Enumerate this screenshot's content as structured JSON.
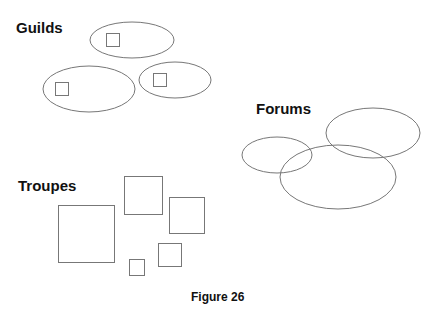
{
  "labels": {
    "guilds": "Guilds",
    "forums": "Forums",
    "troupes": "Troupes"
  },
  "caption": "Figure 26",
  "stroke_color": "#777777",
  "groups": {
    "guilds": {
      "ellipses": [
        {
          "cx": 132,
          "cy": 40,
          "rx": 42,
          "ry": 18,
          "square": {
            "x": 106,
            "y": 33,
            "size": 13
          }
        },
        {
          "cx": 89,
          "cy": 89,
          "rx": 46,
          "ry": 23,
          "square": {
            "x": 55,
            "y": 82,
            "size": 13
          }
        },
        {
          "cx": 175,
          "cy": 80,
          "rx": 36,
          "ry": 18,
          "square": {
            "x": 153,
            "y": 73,
            "size": 13
          }
        }
      ]
    },
    "forums": {
      "ellipses": [
        {
          "cx": 373,
          "cy": 133,
          "rx": 47,
          "ry": 25
        },
        {
          "cx": 277,
          "cy": 155,
          "rx": 35,
          "ry": 18
        },
        {
          "cx": 338,
          "cy": 177,
          "rx": 58,
          "ry": 32
        }
      ]
    },
    "troupes": {
      "squares": [
        {
          "x": 58,
          "y": 205,
          "w": 56,
          "h": 57
        },
        {
          "x": 124,
          "y": 176,
          "w": 38,
          "h": 38
        },
        {
          "x": 169,
          "y": 197,
          "w": 35,
          "h": 36
        },
        {
          "x": 158,
          "y": 243,
          "w": 23,
          "h": 23
        },
        {
          "x": 129,
          "y": 259,
          "w": 15,
          "h": 16
        }
      ]
    }
  }
}
